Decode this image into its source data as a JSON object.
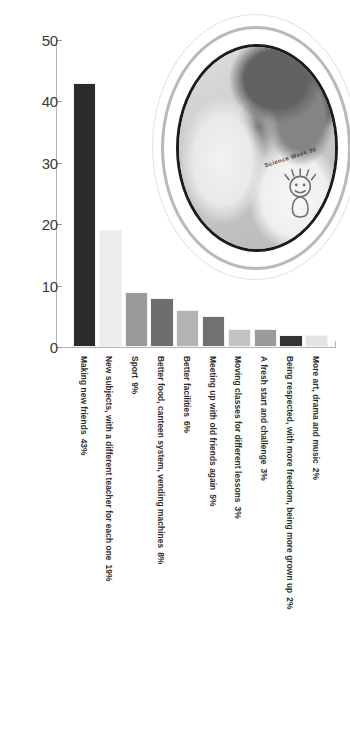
{
  "chart_data": {
    "type": "bar",
    "title": "",
    "subtitle": "",
    "xlabel": "",
    "ylabel": "",
    "ylim": [
      0,
      50
    ],
    "ytick_values": [
      0,
      10,
      20,
      30,
      40,
      50
    ],
    "ytick_labels": [
      "0",
      "10",
      "20",
      "30",
      "40",
      "50"
    ],
    "grid": false,
    "legend": "none",
    "categories": [
      "Making new friends",
      "New subjects, with a different teacher for each one",
      "Sport",
      "Better food, canteen system, vending machines",
      "Better facilities",
      "Meeting up with old friends again",
      "Moving classes for different lessons",
      "A fresh start and challenge",
      "Being respected, with more freedom, being more grown up",
      "More art, drama and music"
    ],
    "values": [
      43,
      19,
      9,
      8,
      6,
      5,
      3,
      3,
      2,
      2
    ],
    "value_labels": [
      "43%",
      "19%",
      "9%",
      "8%",
      "6%",
      "5%",
      "3%",
      "3%",
      "2%",
      "2%"
    ],
    "bar_colors": [
      "#2b2b2b",
      "#eceded",
      "#9a9a9a",
      "#6e6e6e",
      "#b4b4b4",
      "#717171",
      "#c3c3c3",
      "#9b9b9b",
      "#333333",
      "#e3e4e4"
    ]
  },
  "axis": {
    "y_ticks": [
      "50",
      "40",
      "30",
      "20",
      "10",
      "0"
    ]
  },
  "photo": {
    "alt_name": "students-photo",
    "shirt_text": "Science Week 96"
  }
}
